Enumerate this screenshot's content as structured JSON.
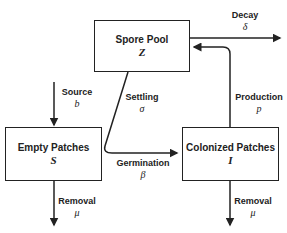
{
  "nodes": {
    "spore_pool": {
      "title": "Spore Pool",
      "symbol": "Z"
    },
    "empty_patches": {
      "title": "Empty Patches",
      "symbol": "S"
    },
    "colonized_patches": {
      "title": "Colonized Patches",
      "symbol": "I"
    }
  },
  "flows": {
    "decay": {
      "label": "Decay",
      "symbol": "δ"
    },
    "source": {
      "label": "Source",
      "symbol": "b"
    },
    "settling": {
      "label": "Settling",
      "symbol": "σ"
    },
    "production": {
      "label": "Production",
      "symbol": "p"
    },
    "germination": {
      "label": "Germination",
      "symbol": "β"
    },
    "removal_empty": {
      "label": "Removal",
      "symbol": "μ"
    },
    "removal_colonized": {
      "label": "Removal",
      "symbol": "μ"
    }
  }
}
